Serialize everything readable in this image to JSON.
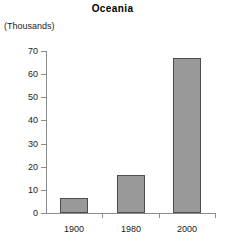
{
  "chart_data": {
    "type": "bar",
    "title": "Oceania",
    "subtitle": "",
    "units_label": "(Thousands)",
    "xlabel": "",
    "ylabel": "",
    "categories": [
      "1900",
      "1980",
      "2000"
    ],
    "values": [
      6.5,
      16.5,
      67
    ],
    "series": [
      {
        "name": "Oceania",
        "values": [
          6.5,
          16.5,
          67
        ]
      }
    ],
    "ylim": [
      0,
      70
    ],
    "ytick_labels": [
      "0",
      "10",
      "20",
      "30",
      "40",
      "50",
      "60",
      "70"
    ],
    "ytick_values": [
      0,
      10,
      20,
      30,
      40,
      50,
      60,
      70
    ],
    "grid": false,
    "legend": false,
    "legend_position": "none",
    "bar_fill_color": "#999999",
    "bar_border_color": "#4d4d4d",
    "axis_color": "#8c8c8c",
    "background_color": "#ffffff",
    "text_color": "#1a1a1a"
  }
}
